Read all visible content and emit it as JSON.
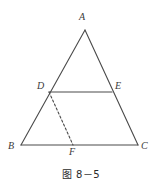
{
  "figure": {
    "caption": "图 8－5",
    "stroke_color": "#4a4a4a",
    "label_color": "#3a3a3a",
    "background_color": "#ffffff",
    "labels": {
      "A": "A",
      "B": "B",
      "C": "C",
      "D": "D",
      "E": "E",
      "F": "F"
    },
    "geometry": {
      "points": {
        "A": [
          85,
          30
        ],
        "B": [
          21,
          145
        ],
        "C": [
          138,
          145
        ],
        "D": [
          49,
          92
        ],
        "E": [
          112,
          92
        ],
        "F": [
          73,
          145
        ]
      },
      "solid_segments": [
        [
          "A",
          "B"
        ],
        [
          "A",
          "C"
        ],
        [
          "B",
          "C"
        ],
        [
          "D",
          "E"
        ]
      ],
      "dashed_segments": [
        [
          "D",
          "F"
        ]
      ]
    }
  }
}
